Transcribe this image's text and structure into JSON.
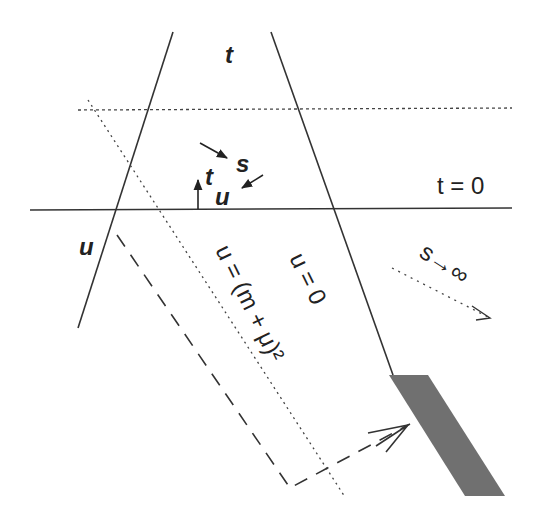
{
  "diagram": {
    "labels": {
      "t_axis": "t",
      "u_axis": "u",
      "s_inner": "s",
      "t_inner": "t",
      "u_inner": "u",
      "t_zero": "t = 0",
      "u_zero": "u = 0",
      "u_threshold": "u = (m + μ)²",
      "s_limit": "s→∞"
    },
    "colors": {
      "line": "#333333",
      "shaded_region": "#707070",
      "background": "#ffffff"
    },
    "lines": [
      {
        "name": "t-axis-line",
        "style": "solid",
        "from": [
          173,
          32
        ],
        "to": [
          78,
          328
        ]
      },
      {
        "name": "u-zero-line",
        "style": "solid",
        "from": [
          271,
          32
        ],
        "to": [
          393,
          373
        ]
      },
      {
        "name": "t-zero-line",
        "style": "solid",
        "from": [
          30,
          210
        ],
        "to": [
          512,
          208
        ]
      },
      {
        "name": "upper-dotted-line",
        "style": "dotted",
        "from": [
          78,
          110
        ],
        "to": [
          512,
          108
        ]
      },
      {
        "name": "threshold-dotted-line",
        "style": "dotted",
        "from": [
          88,
          100
        ],
        "to": [
          345,
          497
        ]
      },
      {
        "name": "s-infinity-arrow",
        "style": "dotted",
        "from": [
          392,
          268
        ],
        "to": [
          490,
          318
        ]
      },
      {
        "name": "dashed-path",
        "style": "dashed",
        "points": [
          [
            117,
            235
          ],
          [
            290,
            488
          ],
          [
            410,
            424
          ]
        ]
      }
    ],
    "shaded_region": [
      [
        389,
        375
      ],
      [
        428,
        375
      ],
      [
        505,
        496
      ],
      [
        465,
        496
      ]
    ]
  }
}
